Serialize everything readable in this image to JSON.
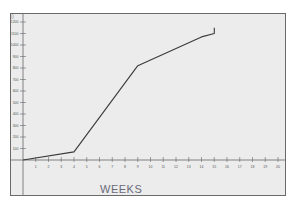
{
  "chart_data": {
    "type": "line",
    "title": "",
    "xlabel": "WEEKS",
    "ylabel": "",
    "x_ticks": [
      "1",
      "2",
      "3",
      "4",
      "5",
      "6",
      "7",
      "8",
      "9",
      "10",
      "11",
      "12",
      "13",
      "14",
      "15",
      "16",
      "17",
      "18",
      "19",
      "20"
    ],
    "y_ticks": [
      "100",
      "200",
      "300",
      "400",
      "500",
      "600",
      "700",
      "800",
      "900",
      "1000",
      "1100",
      "1200"
    ],
    "xlim": [
      0,
      21
    ],
    "ylim": [
      0,
      1200
    ],
    "grid": false,
    "legend": null,
    "series": [
      {
        "name": "cumulative",
        "x": [
          0,
          4,
          9,
          14,
          15,
          15
        ],
        "y": [
          0,
          70,
          820,
          1070,
          1100,
          1150
        ]
      }
    ],
    "colors": {
      "line": "#3a3a3a",
      "frame": "#6a6a6a",
      "background": "#ececec"
    }
  }
}
